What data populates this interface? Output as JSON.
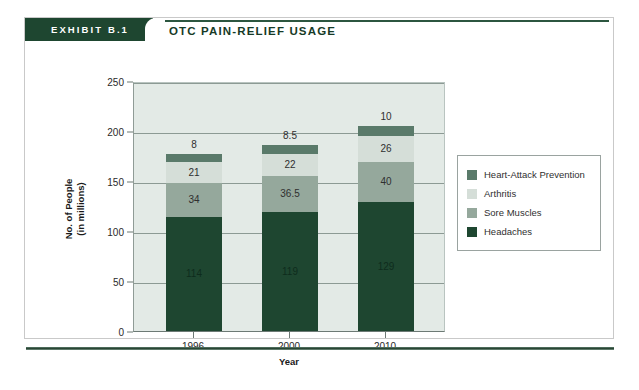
{
  "exhibit": {
    "tab_label": "EXHIBIT B.1",
    "title": "OTC PAIN-RELIEF USAGE"
  },
  "colors": {
    "header_green": "#1e4630",
    "plot_background": "#e3eae6",
    "gridline": "#8c9a94",
    "heart_attack_prevention": "#5a7a6a",
    "arthritis": "#d5ded8",
    "sore_muscles": "#95a89c",
    "headaches": "#1e4630"
  },
  "chart_data": {
    "type": "bar",
    "stacked": true,
    "title": "OTC PAIN-RELIEF USAGE",
    "xlabel": "Year",
    "ylabel": "No. of People (in millions)",
    "ylabel_lines": [
      "No. of People",
      "(in millions)"
    ],
    "categories": [
      "1996",
      "2000",
      "2010"
    ],
    "ylim": [
      0,
      250
    ],
    "yticks": [
      0,
      50,
      100,
      150,
      200,
      250
    ],
    "ytick_labels": [
      "0",
      "50",
      "100",
      "150",
      "200",
      "250"
    ],
    "grid": true,
    "legend_position": "right",
    "series": [
      {
        "name": "Headaches",
        "color": "#1e4630",
        "values": [
          114,
          119,
          129
        ],
        "labels": [
          "114",
          "119",
          "129"
        ]
      },
      {
        "name": "Sore Muscles",
        "color": "#95a89c",
        "values": [
          34,
          36.5,
          40
        ],
        "labels": [
          "34",
          "36.5",
          "40"
        ]
      },
      {
        "name": "Arthritis",
        "color": "#d5ded8",
        "values": [
          21,
          22,
          26
        ],
        "labels": [
          "21",
          "22",
          "26"
        ]
      },
      {
        "name": "Heart-Attack Prevention",
        "color": "#5a7a6a",
        "values": [
          8,
          8.5,
          10
        ],
        "labels": [
          "8",
          "8.5",
          "10"
        ]
      }
    ],
    "totals": [
      177,
      186,
      205
    ],
    "legend": [
      {
        "label": "Heart-Attack Prevention",
        "color": "#5a7a6a"
      },
      {
        "label": "Arthritis",
        "color": "#d5ded8"
      },
      {
        "label": "Sore Muscles",
        "color": "#95a89c"
      },
      {
        "label": "Headaches",
        "color": "#1e4630"
      }
    ]
  }
}
